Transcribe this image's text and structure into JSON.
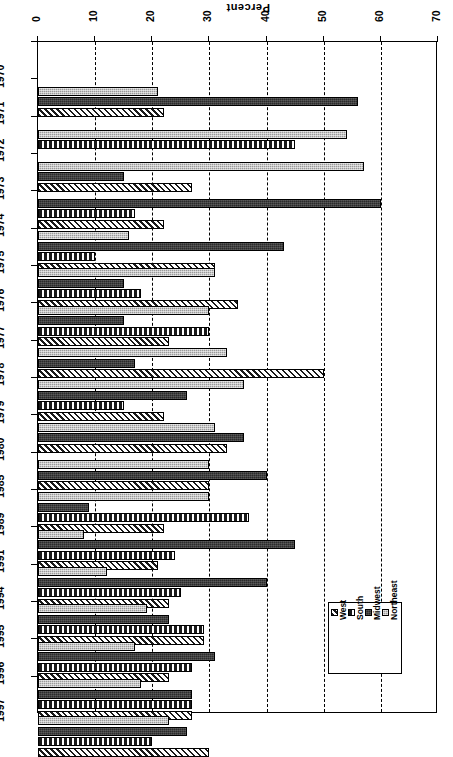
{
  "chart_data": {
    "type": "bar",
    "orientation": "horizontal",
    "title": "Percent",
    "xlabel": "Percent",
    "ylabel": "",
    "xlim": [
      0,
      70
    ],
    "xticks": [
      0,
      10,
      20,
      30,
      40,
      50,
      60,
      70
    ],
    "grid": true,
    "legend_position": "bottom-right",
    "categories": [
      "1970",
      "1971",
      "1972",
      "1973",
      "1974",
      "1975",
      "1976",
      "1977",
      "1978",
      "1979",
      "1980",
      "1985",
      "1989",
      "1991",
      "1994",
      "1995",
      "1996",
      "1997"
    ],
    "series": [
      {
        "name": "Northeast",
        "pattern": "light-grey-stipple",
        "color": "#9a9a9a",
        "values": [
          21,
          54,
          57,
          null,
          16,
          31,
          30,
          33,
          36,
          31,
          30,
          30,
          8,
          12,
          19,
          17,
          18,
          23
        ]
      },
      {
        "name": "Midwest",
        "pattern": "dark-solid",
        "color": "#2b2b2b",
        "values": [
          56,
          null,
          15,
          60,
          43,
          15,
          15,
          17,
          26,
          36,
          40,
          9,
          45,
          40,
          23,
          31,
          27,
          26
        ]
      },
      {
        "name": "South",
        "pattern": "checkered",
        "color": "#1a1a1a",
        "values": [
          null,
          45,
          null,
          17,
          10,
          18,
          30,
          null,
          15,
          null,
          null,
          37,
          24,
          25,
          29,
          27,
          27,
          20
        ]
      },
      {
        "name": "West",
        "pattern": "diagonal-hatch",
        "color": "#1a1a1a",
        "values": [
          22,
          null,
          27,
          22,
          31,
          35,
          23,
          50,
          22,
          33,
          30,
          22,
          21,
          23,
          29,
          23,
          27,
          30
        ]
      }
    ]
  },
  "legend": {
    "entries": [
      {
        "label": "Northeast",
        "key": "northeast"
      },
      {
        "label": "Midwest",
        "key": "midwest"
      },
      {
        "label": "South",
        "key": "south"
      },
      {
        "label": "West",
        "key": "west"
      }
    ]
  }
}
